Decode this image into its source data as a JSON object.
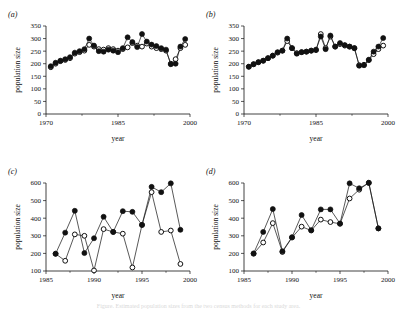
{
  "figure": {
    "background": "#ffffff",
    "ink_color": "#111111",
    "caption_fragment": "Figure. Estimated population sizes from the two census methods for each study area."
  },
  "chart_data": [
    {
      "type": "line",
      "panel_label": "(a)",
      "title": "",
      "xlabel": "year",
      "ylabel": "population size",
      "xlim": [
        1970,
        2000
      ],
      "ylim": [
        0,
        350
      ],
      "xticks": [
        1970,
        1985,
        2000
      ],
      "xtick_labels": [
        "1970",
        "1985",
        "2000"
      ],
      "yticks": [
        0,
        50,
        100,
        150,
        200,
        250,
        300,
        350
      ],
      "ytick_labels": [
        "0",
        "50",
        "100",
        "150",
        "200",
        "250",
        "300",
        "350"
      ],
      "grid": false,
      "legend": "none",
      "x": [
        1971,
        1972,
        1973,
        1974,
        1975,
        1976,
        1977,
        1978,
        1979,
        1980,
        1981,
        1982,
        1983,
        1984,
        1985,
        1986,
        1987,
        1988,
        1989,
        1990,
        1991,
        1992,
        1993,
        1994,
        1995,
        1996,
        1997,
        1998,
        1999
      ],
      "series": [
        {
          "name": "open-circle series",
          "marker": "open-circle",
          "values": [
            186,
            200,
            210,
            215,
            222,
            240,
            246,
            252,
            275,
            268,
            258,
            256,
            262,
            258,
            252,
            258,
            265,
            282,
            272,
            268,
            280,
            268,
            262,
            258,
            252,
            200,
            218,
            262,
            275
          ]
        },
        {
          "name": "filled-circle series",
          "marker": "filled-circle",
          "values": [
            190,
            204,
            212,
            218,
            226,
            244,
            250,
            258,
            300,
            272,
            250,
            248,
            256,
            252,
            246,
            262,
            305,
            286,
            266,
            318,
            288,
            276,
            270,
            262,
            256,
            198,
            200,
            268,
            298
          ]
        }
      ]
    },
    {
      "type": "line",
      "panel_label": "(b)",
      "title": "",
      "xlabel": "year",
      "ylabel": "population size",
      "xlim": [
        1970,
        2000
      ],
      "ylim": [
        0,
        350
      ],
      "xticks": [
        1970,
        1985,
        2000
      ],
      "xtick_labels": [
        "1970",
        "1985",
        "2000"
      ],
      "yticks": [
        0,
        50,
        100,
        150,
        200,
        250,
        300,
        350
      ],
      "ytick_labels": [
        "0",
        "50",
        "100",
        "150",
        "200",
        "250",
        "300",
        "350"
      ],
      "grid": false,
      "legend": "none",
      "x": [
        1971,
        1972,
        1973,
        1974,
        1975,
        1976,
        1977,
        1978,
        1979,
        1980,
        1981,
        1982,
        1983,
        1984,
        1985,
        1986,
        1987,
        1988,
        1989,
        1990,
        1991,
        1992,
        1993,
        1994,
        1995,
        1996,
        1997,
        1998,
        1999
      ],
      "series": [
        {
          "name": "open-circle series",
          "marker": "open-circle",
          "values": [
            188,
            198,
            206,
            212,
            222,
            232,
            244,
            252,
            290,
            262,
            242,
            246,
            248,
            252,
            254,
            318,
            262,
            308,
            268,
            278,
            272,
            268,
            262,
            194,
            196,
            214,
            238,
            258,
            272
          ]
        },
        {
          "name": "filled-circle series",
          "marker": "filled-circle",
          "values": [
            188,
            198,
            206,
            212,
            222,
            232,
            246,
            252,
            300,
            262,
            240,
            246,
            248,
            252,
            256,
            308,
            258,
            312,
            268,
            282,
            274,
            268,
            262,
            192,
            194,
            216,
            248,
            268,
            302
          ]
        }
      ]
    },
    {
      "type": "line",
      "panel_label": "(c)",
      "title": "",
      "xlabel": "year",
      "ylabel": "population size",
      "xlim": [
        1985,
        2000
      ],
      "ylim": [
        100,
        600
      ],
      "xticks": [
        1985,
        1990,
        1995,
        2000
      ],
      "xtick_labels": [
        "1985",
        "1990",
        "1995",
        "2000"
      ],
      "yticks": [
        100,
        200,
        300,
        400,
        500,
        600
      ],
      "ytick_labels": [
        "100",
        "200",
        "300",
        "400",
        "500",
        "600"
      ],
      "grid": false,
      "legend": "none",
      "x": [
        1986,
        1987,
        1988,
        1989,
        1990,
        1991,
        1992,
        1993,
        1994,
        1995,
        1996,
        1997,
        1998,
        1999
      ],
      "series": [
        {
          "name": "open-circle series",
          "marker": "open-circle",
          "values": [
            198,
            158,
            308,
            300,
            103,
            338,
            322,
            312,
            120,
            362,
            548,
            322,
            330,
            140
          ]
        },
        {
          "name": "filled-circle series",
          "marker": "filled-circle",
          "values": [
            198,
            318,
            442,
            202,
            286,
            408,
            322,
            440,
            436,
            362,
            578,
            548,
            598,
            334
          ]
        }
      ]
    },
    {
      "type": "line",
      "panel_label": "(d)",
      "title": "",
      "xlabel": "year",
      "ylabel": "population size",
      "xlim": [
        1985,
        2000
      ],
      "ylim": [
        100,
        600
      ],
      "xticks": [
        1985,
        1990,
        1995,
        2000
      ],
      "xtick_labels": [
        "1985",
        "1990",
        "1995",
        "2000"
      ],
      "yticks": [
        100,
        200,
        300,
        400,
        500,
        600
      ],
      "ytick_labels": [
        "100",
        "200",
        "300",
        "400",
        "500",
        "600"
      ],
      "grid": false,
      "legend": "none",
      "x": [
        1986,
        1987,
        1988,
        1989,
        1990,
        1991,
        1992,
        1993,
        1994,
        1995,
        1996,
        1997,
        1998,
        1999
      ],
      "series": [
        {
          "name": "open-circle series",
          "marker": "open-circle",
          "values": [
            198,
            262,
            372,
            208,
            290,
            352,
            330,
            392,
            378,
            368,
            512,
            562,
            602,
            342
          ]
        },
        {
          "name": "filled-circle series",
          "marker": "filled-circle",
          "values": [
            200,
            322,
            452,
            212,
            292,
            418,
            332,
            450,
            450,
            370,
            598,
            570,
            600,
            342
          ]
        }
      ]
    }
  ]
}
